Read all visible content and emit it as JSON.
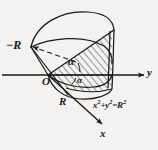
{
  "figure": {
    "kind": "math-solid-diagram",
    "background_color": "#f3f2f0",
    "ink_color": "#1a1a1a"
  },
  "axes": {
    "y_axis": {
      "label": "y",
      "direction": "right",
      "arrow": true
    },
    "x_axis": {
      "label": "x",
      "direction": "down-right",
      "arrow": true
    },
    "origin": {
      "label": "O"
    }
  },
  "labels": {
    "minus_r": "−R",
    "r": "R",
    "alpha_upper": "α",
    "alpha_lower": "α",
    "equation": "x²+y²=R²",
    "equation_base_x": "x",
    "equation_sup_1": "2",
    "equation_plus": "+",
    "equation_base_y": "y",
    "equation_sup_2": "2",
    "equation_equals": "=",
    "equation_base_r": "R",
    "equation_sup_3": "2"
  },
  "annotations": {
    "leader_line_style": "dashed",
    "hatch_style": "diagonal-lines"
  }
}
